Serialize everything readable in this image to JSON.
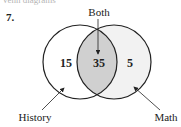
{
  "header": {
    "partial_text": "Venn diagrams",
    "problem_number": "7."
  },
  "diagram": {
    "type": "venn",
    "sets": [
      {
        "name": "History",
        "only_count": "15"
      },
      {
        "name": "Math",
        "only_count": "5"
      }
    ],
    "intersection": {
      "label": "Both",
      "count": "35"
    },
    "labels": {
      "top": "Both",
      "left": "History",
      "right": "Math"
    },
    "colors": {
      "intersection_fill": "#d0d0d0",
      "right_fill": "#f2f2f2",
      "stroke": "#222222"
    }
  }
}
